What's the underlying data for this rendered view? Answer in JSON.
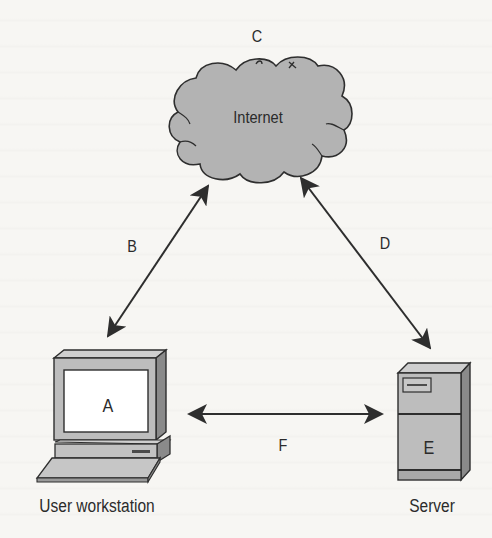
{
  "diagram": {
    "type": "network-topology",
    "nodes": {
      "internet": {
        "letter": "C",
        "label": "Internet",
        "shape": "cloud"
      },
      "workstation": {
        "letter": "A",
        "label": "User workstation",
        "shape": "desktop-computer"
      },
      "server": {
        "letter": "E",
        "label": "Server",
        "shape": "tower-server"
      }
    },
    "connections": [
      {
        "letter": "B",
        "from": "User workstation",
        "to": "Internet",
        "direction": "bidirectional"
      },
      {
        "letter": "D",
        "from": "Internet",
        "to": "Server",
        "direction": "bidirectional"
      },
      {
        "letter": "F",
        "from": "User workstation",
        "to": "Server",
        "direction": "bidirectional"
      }
    ]
  },
  "colors": {
    "background": "#f7f6f3",
    "cloud_fill": "#b3b3b3",
    "device_fill": "#bdbdbd",
    "device_side": "#8a8a8a",
    "outline": "#2e2e2e",
    "screen": "#ffffff"
  }
}
